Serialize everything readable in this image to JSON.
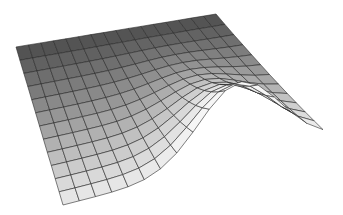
{
  "chart_data": {
    "type": "surface",
    "title": "",
    "xlabel": "",
    "ylabel": "",
    "zlabel": "",
    "grid": true,
    "legend": null,
    "grid_cols": 16,
    "grid_rows": 12,
    "corners_px": {
      "back_left": [
        16,
        47
      ],
      "back_right": [
        216,
        14
      ],
      "front_right": [
        323,
        139
      ],
      "front_left": [
        63,
        205
      ]
    },
    "ridge": {
      "position_along_front": 0.68,
      "height_px": 78,
      "width": 0.22
    },
    "colors": {
      "dark": "#3a3a3a",
      "light": "#f6f6f6",
      "line": "#2a2a2a",
      "background": "#ffffff"
    }
  }
}
